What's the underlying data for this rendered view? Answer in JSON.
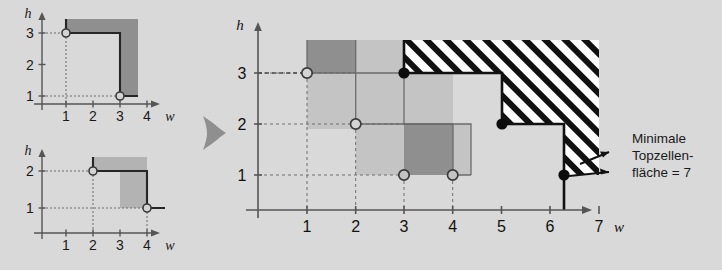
{
  "figure": {
    "background_color": "#d9d9d9",
    "ink_color": "#262626",
    "axis_color": "#555555",
    "dark_fill": "#8c8c8c",
    "light_fill": "#c2c2c2",
    "arrow_color": "#8f8f8f",
    "annotation": {
      "line1": "Minimale",
      "line2": "Topzellen-",
      "line3": "fläche = 7",
      "value": 7
    }
  },
  "panels": [
    {
      "id": "panel-top-left",
      "name": "staircase-chart-1",
      "axis": {
        "xlabel": "w",
        "ylabel": "h",
        "xticks": [
          "1",
          "2",
          "3",
          "4"
        ],
        "yticks": [
          "1",
          "2",
          "3"
        ],
        "xrange": [
          0,
          4.6
        ],
        "yrange": [
          0,
          3.6
        ]
      },
      "points": [
        {
          "w": 1,
          "h": 3,
          "filled": false
        },
        {
          "w": 3,
          "h": 1,
          "filled": false
        }
      ],
      "staircase": [
        [
          1,
          3
        ],
        [
          3,
          3
        ],
        [
          3,
          1
        ],
        [
          3.6,
          1
        ]
      ],
      "dark_band_top": 3.45
    },
    {
      "id": "panel-bottom-left",
      "name": "staircase-chart-2",
      "axis": {
        "xlabel": "w",
        "ylabel": "h",
        "xticks": [
          "1",
          "2",
          "3",
          "4"
        ],
        "yticks": [
          "1",
          "2"
        ],
        "xrange": [
          0,
          4.6
        ],
        "yrange": [
          0,
          2.6
        ]
      },
      "points": [
        {
          "w": 2,
          "h": 2,
          "filled": false
        },
        {
          "w": 4,
          "h": 1,
          "filled": false
        }
      ],
      "staircase": [
        [
          2,
          2
        ],
        [
          4,
          2
        ],
        [
          4,
          1
        ],
        [
          4.6,
          1
        ]
      ],
      "dark_band_top": 2.45
    },
    {
      "id": "panel-main",
      "name": "combined-topcell-chart",
      "axis": {
        "xlabel": "w",
        "ylabel": "h",
        "xticks": [
          "1",
          "2",
          "3",
          "4",
          "5",
          "6",
          "7"
        ],
        "yticks": [
          "1",
          "2",
          "3"
        ],
        "xrange": [
          0,
          7.6
        ],
        "yrange": [
          0,
          3.6
        ]
      },
      "open_points": [
        {
          "w": 1,
          "h": 3
        },
        {
          "w": 2,
          "h": 2
        },
        {
          "w": 3,
          "h": 1
        },
        {
          "w": 4,
          "h": 1
        }
      ],
      "filled_points": [
        {
          "w": 3,
          "h": 3
        },
        {
          "w": 5,
          "h": 2
        },
        {
          "w": 7,
          "h": 1
        }
      ],
      "minimal_staircase": [
        [
          3,
          3.45
        ],
        [
          3,
          3
        ],
        [
          5,
          3
        ],
        [
          5,
          2
        ],
        [
          7,
          2
        ],
        [
          7,
          1
        ],
        [
          7,
          0
        ]
      ],
      "hatched_area": 7
    }
  ],
  "arrow": {
    "name": "flow-arrow",
    "direction": "right"
  }
}
